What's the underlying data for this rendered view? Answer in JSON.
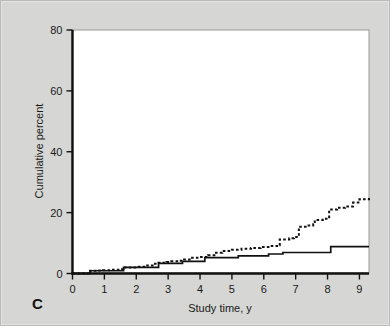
{
  "figure": {
    "panel_label": "C",
    "background_color": "#d6d6d4",
    "plot_background_color": "#ffffff"
  },
  "chart_data": {
    "type": "line",
    "title": "",
    "subtitle": "",
    "xlabel": "Study time, y",
    "ylabel": "Cumulative percent",
    "xlim": [
      0,
      9.3
    ],
    "ylim": [
      0,
      80
    ],
    "xticks": [
      0,
      1,
      2,
      3,
      4,
      5,
      6,
      7,
      8,
      9
    ],
    "xticklabels": [
      "0",
      "1",
      "2",
      "3",
      "4",
      "5",
      "6",
      "7",
      "8",
      "9"
    ],
    "yticks": [
      0,
      20,
      40,
      60,
      80
    ],
    "yticklabels": [
      "0",
      "20",
      "40",
      "60",
      "80"
    ],
    "grid": false,
    "legend": "none",
    "curve_style": "step",
    "series": [
      {
        "name": "dashed-curve",
        "line_style": "dashed",
        "color": "#111111",
        "x": [
          0,
          0.55,
          0.75,
          0.95,
          1.2,
          1.55,
          1.6,
          2.0,
          2.25,
          2.55,
          2.7,
          2.95,
          3.1,
          3.35,
          3.5,
          3.75,
          4.0,
          4.25,
          4.45,
          4.7,
          5.0,
          5.3,
          5.6,
          5.9,
          6.2,
          6.45,
          6.5,
          6.8,
          6.95,
          7.1,
          7.35,
          7.55,
          7.6,
          7.85,
          8.05,
          8.3,
          8.55,
          8.8,
          9.0,
          9.3
        ],
        "y": [
          0,
          0.9,
          1.0,
          1.1,
          1.2,
          1.4,
          2.0,
          2.2,
          2.6,
          3.2,
          3.5,
          3.8,
          4.0,
          4.2,
          4.6,
          5.2,
          5.4,
          6.0,
          6.8,
          7.4,
          7.8,
          8.1,
          8.4,
          8.7,
          9.0,
          9.3,
          11.2,
          11.6,
          12.0,
          15.4,
          15.8,
          16.2,
          17.6,
          18.0,
          21.0,
          21.6,
          22.0,
          23.3,
          24.4,
          24.8
        ]
      },
      {
        "name": "solid-curve",
        "line_style": "solid",
        "color": "#111111",
        "x": [
          0,
          0.55,
          1.55,
          1.6,
          2.55,
          2.7,
          3.3,
          3.45,
          4.0,
          4.15,
          5.05,
          5.2,
          6.0,
          6.15,
          6.45,
          6.6,
          8.0,
          8.1,
          9.3
        ],
        "y": [
          0,
          0.9,
          0.9,
          2.0,
          2.0,
          3.3,
          3.3,
          4.0,
          4.0,
          5.2,
          5.2,
          5.8,
          5.8,
          6.4,
          6.4,
          6.9,
          6.9,
          8.8,
          8.8
        ]
      }
    ]
  }
}
